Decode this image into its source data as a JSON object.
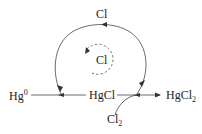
{
  "diagram": {
    "type": "reaction-cycle",
    "nodes": {
      "hg0": {
        "base": "Hg",
        "sup": "0"
      },
      "hgcl": {
        "text": "HgCl"
      },
      "hgcl2": {
        "base": "HgCl",
        "sub": "2"
      },
      "cl_top": {
        "text": "Cl"
      },
      "cl_inner": {
        "text": "Cl"
      },
      "cl2": {
        "base": "Cl",
        "sub": "2"
      }
    },
    "edges": [
      {
        "from": "Hg0",
        "to": "HgCl",
        "style": "solid-arrow"
      },
      {
        "from": "HgCl",
        "to": "HgCl2",
        "style": "solid-arrow"
      },
      {
        "from": "Cl2",
        "to": "HgCl-HgCl2 junction",
        "style": "curved-solid-arrow"
      },
      {
        "from": "junction",
        "to": "Cl (top)",
        "style": "arc-solid-arrow"
      },
      {
        "from": "Cl (top)",
        "to": "Hg0-HgCl line",
        "style": "arc-solid-arrow"
      },
      {
        "from": "Cl (inner)",
        "to": "Cl (inner)",
        "style": "dashed-circular-arrow"
      }
    ],
    "colors": {
      "line": "#333333",
      "dashed": "#555555",
      "text": "#222222"
    }
  }
}
